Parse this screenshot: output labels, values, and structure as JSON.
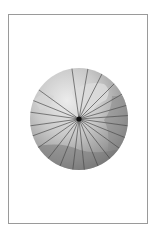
{
  "figure": {
    "type": "sphere-with-radiating-lines",
    "frame": {
      "x": 8,
      "y": 14,
      "width": 140,
      "height": 210,
      "border_color": "#9a9a9a"
    },
    "sphere": {
      "cx": 79,
      "cy": 119,
      "rx": 49,
      "ry": 51,
      "colors": {
        "light": "#e2e2e2",
        "mid": "#b8b8b8",
        "dark": "#7e7e7e",
        "edge": "#6a6a6a"
      }
    },
    "center_point": {
      "x": 79,
      "y": 119,
      "r": 2.6,
      "color": "#111111"
    },
    "line_color": "#4a4a4a",
    "line_angles_deg": [
      -98,
      -80,
      -63,
      -45,
      -30,
      -16,
      -4,
      8,
      22,
      36,
      52,
      68,
      84,
      97,
      112,
      128,
      145,
      160,
      172,
      188,
      202,
      216
    ]
  }
}
